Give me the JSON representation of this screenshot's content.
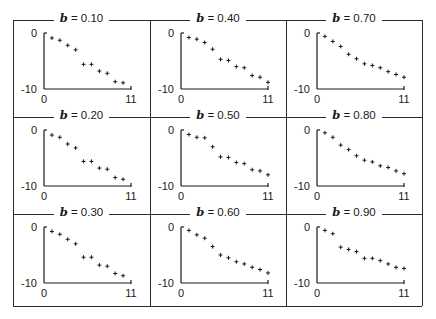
{
  "chart_data": [
    {
      "type": "scatter",
      "title": "b = 0.10",
      "param": "b",
      "param_value": 0.1,
      "x": [
        1,
        2,
        3,
        4,
        5,
        6,
        7,
        8,
        9,
        10,
        11
      ],
      "y": [
        -0.9,
        -1.3,
        -2.2,
        -3.0,
        -5.6,
        -5.6,
        -6.8,
        -7.2,
        -8.7,
        -8.9,
        null
      ],
      "xlabel": "",
      "ylabel": "",
      "xlim": [
        0,
        11
      ],
      "ylim": [
        -10,
        0
      ],
      "xticks": [
        "0",
        "11"
      ],
      "yticks": [
        "0",
        "-10"
      ],
      "marker": "+",
      "grid": false
    },
    {
      "type": "scatter",
      "title": "b = 0.40",
      "param": "b",
      "param_value": 0.4,
      "x": [
        1,
        2,
        3,
        4,
        5,
        6,
        7,
        8,
        9,
        10,
        11
      ],
      "y": [
        -0.8,
        -1.1,
        -1.7,
        -2.9,
        -4.7,
        -4.9,
        -6.0,
        -6.2,
        -7.6,
        -7.9,
        -8.8
      ],
      "xlabel": "",
      "ylabel": "",
      "xlim": [
        0,
        11
      ],
      "ylim": [
        -10,
        0
      ],
      "xticks": [
        "0",
        "11"
      ],
      "yticks": [
        "0",
        "-10"
      ],
      "marker": "+",
      "grid": false
    },
    {
      "type": "scatter",
      "title": "b = 0.70",
      "param": "b",
      "param_value": 0.7,
      "x": [
        1,
        2,
        3,
        4,
        5,
        6,
        7,
        8,
        9,
        10,
        11
      ],
      "y": [
        -0.6,
        -1.5,
        -2.4,
        -3.8,
        -4.6,
        -5.5,
        -5.8,
        -6.2,
        -6.9,
        -7.4,
        -7.9
      ],
      "xlabel": "",
      "ylabel": "",
      "xlim": [
        0,
        11
      ],
      "ylim": [
        -10,
        0
      ],
      "xticks": [
        "0",
        "11"
      ],
      "yticks": [
        "0",
        "-10"
      ],
      "marker": "+",
      "grid": false
    },
    {
      "type": "scatter",
      "title": "b = 0.20",
      "param": "b",
      "param_value": 0.2,
      "x": [
        1,
        2,
        3,
        4,
        5,
        6,
        7,
        8,
        9,
        10,
        11
      ],
      "y": [
        -0.9,
        -1.3,
        -2.5,
        -3.2,
        -5.6,
        -5.6,
        -6.8,
        -7.0,
        -8.5,
        -8.8,
        null
      ],
      "xlabel": "",
      "ylabel": "",
      "xlim": [
        0,
        11
      ],
      "ylim": [
        -10,
        0
      ],
      "xticks": [
        "0",
        "11"
      ],
      "yticks": [
        "0",
        "-10"
      ],
      "marker": "+",
      "grid": false
    },
    {
      "type": "scatter",
      "title": "b = 0.50",
      "param": "b",
      "param_value": 0.5,
      "x": [
        1,
        2,
        3,
        4,
        5,
        6,
        7,
        8,
        9,
        10,
        11
      ],
      "y": [
        -0.8,
        -1.3,
        -1.4,
        -3.0,
        -4.8,
        -4.9,
        -5.8,
        -6.0,
        -7.1,
        -7.3,
        -8.0
      ],
      "xlabel": "",
      "ylabel": "",
      "xlim": [
        0,
        11
      ],
      "ylim": [
        -10,
        0
      ],
      "xticks": [
        "0",
        "11"
      ],
      "yticks": [
        "0",
        "-10"
      ],
      "marker": "+",
      "grid": false
    },
    {
      "type": "scatter",
      "title": "b = 0.80",
      "param": "b",
      "param_value": 0.8,
      "x": [
        1,
        2,
        3,
        4,
        5,
        6,
        7,
        8,
        9,
        10,
        11
      ],
      "y": [
        -0.5,
        -1.3,
        -2.7,
        -3.5,
        -4.6,
        -5.4,
        -5.7,
        -6.4,
        -6.7,
        -7.3,
        -7.8
      ],
      "xlabel": "",
      "ylabel": "",
      "xlim": [
        0,
        11
      ],
      "ylim": [
        -10,
        0
      ],
      "xticks": [
        "0",
        "11"
      ],
      "yticks": [
        "0",
        "-10"
      ],
      "marker": "+",
      "grid": false
    },
    {
      "type": "scatter",
      "title": "b = 0.30",
      "param": "b",
      "param_value": 0.3,
      "x": [
        1,
        2,
        3,
        4,
        5,
        6,
        7,
        8,
        9,
        10,
        11
      ],
      "y": [
        -0.8,
        -1.3,
        -2.2,
        -3.0,
        -5.4,
        -5.4,
        -6.8,
        -7.0,
        -8.3,
        -8.7,
        null
      ],
      "xlabel": "",
      "ylabel": "",
      "xlim": [
        0,
        11
      ],
      "ylim": [
        -10,
        0
      ],
      "xticks": [
        "0",
        "11"
      ],
      "yticks": [
        "0",
        "-10"
      ],
      "marker": "+",
      "grid": false
    },
    {
      "type": "scatter",
      "title": "b = 0.60",
      "param": "b",
      "param_value": 0.6,
      "x": [
        1,
        2,
        3,
        4,
        5,
        6,
        7,
        8,
        9,
        10,
        11
      ],
      "y": [
        -0.6,
        -1.4,
        -2.0,
        -3.5,
        -5.0,
        -5.5,
        -6.2,
        -6.6,
        -7.2,
        -7.6,
        -8.2
      ],
      "xlabel": "",
      "ylabel": "",
      "xlim": [
        0,
        11
      ],
      "ylim": [
        -10,
        0
      ],
      "xticks": [
        "0",
        "11"
      ],
      "yticks": [
        "0",
        "-10"
      ],
      "marker": "+",
      "grid": false
    },
    {
      "type": "scatter",
      "title": "b = 0.90",
      "param": "b",
      "param_value": 0.9,
      "x": [
        1,
        2,
        3,
        4,
        5,
        6,
        7,
        8,
        9,
        10,
        11
      ],
      "y": [
        -0.6,
        -1.2,
        -3.6,
        -4.0,
        -4.4,
        -5.6,
        -5.6,
        -6.0,
        -6.6,
        -7.2,
        -7.4
      ],
      "xlabel": "",
      "ylabel": "",
      "xlim": [
        0,
        11
      ],
      "ylim": [
        -10,
        0
      ],
      "xticks": [
        "0",
        "11"
      ],
      "yticks": [
        "0",
        "-10"
      ],
      "marker": "+",
      "grid": false
    }
  ],
  "layout": {
    "rows": 3,
    "cols": 3,
    "order": "column-major by b: rows = [0.10,0.40,0.70],[0.20,0.50,0.80],[0.30,0.60,0.90]"
  },
  "panels": [
    {
      "label_var": "b",
      "label_eq": " = 0.10",
      "y_top": "0",
      "y_bottom": "-10",
      "x_left": "0",
      "x_right": "11"
    },
    {
      "label_var": "b",
      "label_eq": " = 0.40",
      "y_top": "0",
      "y_bottom": "-10",
      "x_left": "0",
      "x_right": "11"
    },
    {
      "label_var": "b",
      "label_eq": " = 0.70",
      "y_top": "0",
      "y_bottom": "-10",
      "x_left": "0",
      "x_right": "11"
    },
    {
      "label_var": "b",
      "label_eq": " = 0.20",
      "y_top": "0",
      "y_bottom": "-10",
      "x_left": "0",
      "x_right": "11"
    },
    {
      "label_var": "b",
      "label_eq": " = 0.50",
      "y_top": "0",
      "y_bottom": "-10",
      "x_left": "0",
      "x_right": "11"
    },
    {
      "label_var": "b",
      "label_eq": " = 0.80",
      "y_top": "0",
      "y_bottom": "-10",
      "x_left": "0",
      "x_right": "11"
    },
    {
      "label_var": "b",
      "label_eq": " = 0.30",
      "y_top": "0",
      "y_bottom": "-10",
      "x_left": "0",
      "x_right": "11"
    },
    {
      "label_var": "b",
      "label_eq": " = 0.60",
      "y_top": "0",
      "y_bottom": "-10",
      "x_left": "0",
      "x_right": "11"
    },
    {
      "label_var": "b",
      "label_eq": " = 0.90",
      "y_top": "0",
      "y_bottom": "-10",
      "x_left": "0",
      "x_right": "11"
    }
  ],
  "colors": {
    "ink": "#1a1a1a",
    "frame": "#2a2a2a",
    "background": "#ffffff"
  }
}
